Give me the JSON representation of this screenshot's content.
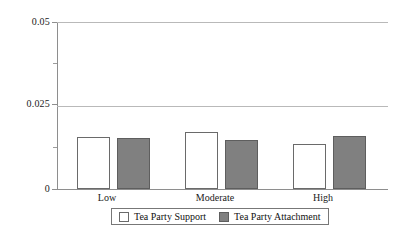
{
  "chart_data": {
    "type": "bar",
    "title": "",
    "subtitle": "",
    "xlabel": "",
    "ylabel": "",
    "categories": [
      "Low",
      "Moderate",
      "High"
    ],
    "series": [
      {
        "name": "Tea Party Support",
        "values": [
          0.0155,
          0.0172,
          0.0135
        ],
        "style": "open"
      },
      {
        "name": "Tea Party Attachment",
        "values": [
          0.0152,
          0.0148,
          0.0158
        ],
        "style": "filled"
      }
    ],
    "ylim": [
      0,
      0.05
    ],
    "yticks": [
      0,
      0.025,
      0.05
    ],
    "ytick_labels": [
      "0",
      "0.025",
      "0.05"
    ],
    "yminor_ticks": [
      0.0125,
      0.0375
    ],
    "grid": "horizontal",
    "legend_position": "bottom",
    "colors": {
      "open_fill": "#ffffff",
      "open_edge": "#6a6a6a",
      "filled_fill": "#808080",
      "filled_edge": "#5e5e5e",
      "axis": "#8e8e8e",
      "grid": "#b9b9b9",
      "background": "#ffffff",
      "text": "#111111"
    }
  },
  "axis": {
    "ytick_0": "0",
    "ytick_1": "0.025",
    "ytick_2": "0.05"
  },
  "categories": {
    "c0": "Low",
    "c1": "Moderate",
    "c2": "High"
  },
  "legend": {
    "item0": "Tea Party Support",
    "item1": "Tea Party Attachment"
  }
}
